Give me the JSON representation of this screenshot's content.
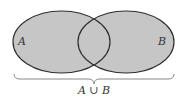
{
  "diagram": {
    "type": "venn",
    "sets": [
      {
        "id": "A",
        "label": "A"
      },
      {
        "id": "B",
        "label": "B"
      }
    ],
    "shaded_region": "A ∪ B",
    "caption": "A ∪ B",
    "colors": {
      "fill": "#c6c6c6",
      "stroke": "#2e2e2e",
      "brace": "#888888"
    }
  }
}
